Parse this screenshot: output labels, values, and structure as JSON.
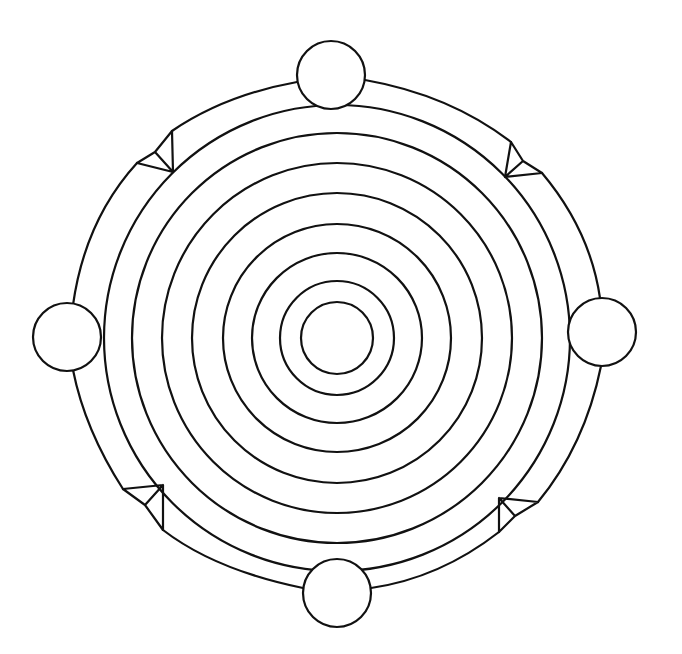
{
  "diagram": {
    "type": "concentric-rings-with-nodes",
    "background": "#ffffff",
    "stroke_color": "#111111",
    "center": [
      337,
      338
    ],
    "rings": [
      {
        "id": "ring-1",
        "r": 36
      },
      {
        "id": "ring-2",
        "r": 57
      },
      {
        "id": "ring-3",
        "r": 85
      },
      {
        "id": "ring-4",
        "r": 114
      },
      {
        "id": "ring-5",
        "r": 145
      },
      {
        "id": "ring-6",
        "r": 175
      },
      {
        "id": "ring-7",
        "r": 205
      },
      {
        "id": "ring-8",
        "r": 233
      }
    ],
    "outer_band_radius": 264,
    "nodes": [
      {
        "id": "node-top",
        "cx": 331,
        "cy": 75,
        "r": 34
      },
      {
        "id": "node-right",
        "cx": 602,
        "cy": 332,
        "r": 34
      },
      {
        "id": "node-bottom",
        "cx": 337,
        "cy": 593,
        "r": 34
      },
      {
        "id": "node-left",
        "cx": 67,
        "cy": 337,
        "r": 34
      }
    ],
    "notches": [
      {
        "id": "notch-top-left",
        "points": {
          "a": [
            172,
            131
          ],
          "b": [
            155,
            152
          ],
          "c": [
            137,
            163
          ],
          "d": [
            173,
            172
          ]
        }
      },
      {
        "id": "notch-top-right",
        "points": {
          "a": [
            511,
            142
          ],
          "b": [
            523,
            161
          ],
          "c": [
            542,
            173
          ],
          "d": [
            505,
            177
          ]
        }
      },
      {
        "id": "notch-bottom-left",
        "points": {
          "a": [
            123,
            489
          ],
          "b": [
            145,
            505
          ],
          "c": [
            163,
            530
          ],
          "d": [
            163,
            485
          ]
        }
      },
      {
        "id": "notch-bottom-right",
        "points": {
          "a": [
            538,
            502
          ],
          "b": [
            515,
            516
          ],
          "c": [
            499,
            532
          ],
          "d": [
            499,
            498
          ]
        }
      }
    ]
  }
}
